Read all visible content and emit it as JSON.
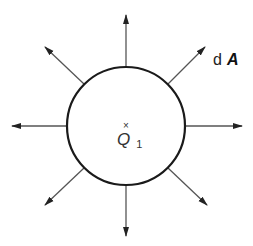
{
  "figure": {
    "colors": {
      "background": "#ffffff",
      "stroke": "#222222",
      "arrow_line": "#555555"
    },
    "sphere": {
      "center": [
        126,
        126
      ],
      "radius": 59
    },
    "charge": {
      "marker": "×",
      "symbol": "Q",
      "subscript": "1"
    },
    "vector_label": {
      "prefix": "d",
      "symbol": "A"
    },
    "arrows": [
      {
        "direction": "up",
        "from": [
          126,
          67
        ],
        "to": [
          126,
          15
        ]
      },
      {
        "direction": "up-right",
        "from": [
          168,
          84
        ],
        "to": [
          205,
          47
        ]
      },
      {
        "direction": "right",
        "from": [
          185,
          126
        ],
        "to": [
          242,
          126
        ]
      },
      {
        "direction": "down-right",
        "from": [
          168,
          168
        ],
        "to": [
          207,
          205
        ]
      },
      {
        "direction": "down",
        "from": [
          126,
          185
        ],
        "to": [
          126,
          236
        ]
      },
      {
        "direction": "down-left",
        "from": [
          84,
          168
        ],
        "to": [
          45,
          205
        ]
      },
      {
        "direction": "left",
        "from": [
          67,
          126
        ],
        "to": [
          12,
          126
        ]
      },
      {
        "direction": "up-left",
        "from": [
          84,
          84
        ],
        "to": [
          45,
          47
        ]
      }
    ]
  }
}
